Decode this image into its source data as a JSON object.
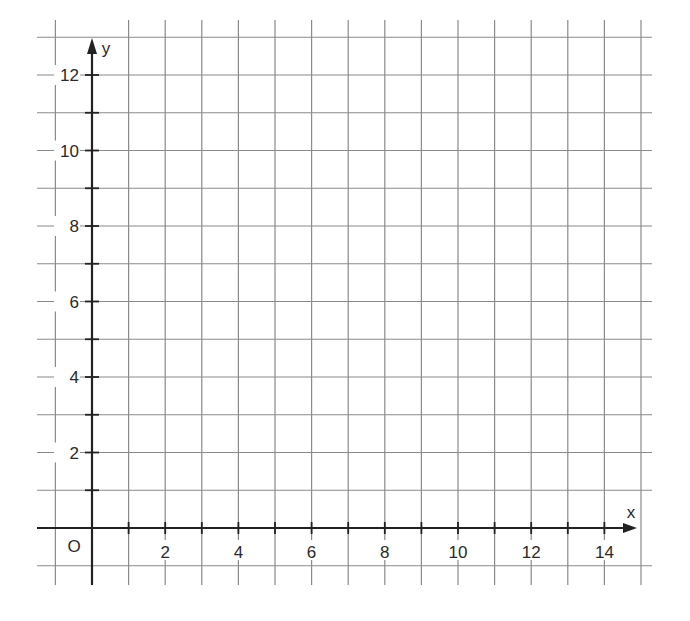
{
  "chart_data": {
    "type": "scatter",
    "title": "",
    "xlabel": "x",
    "ylabel": "y",
    "origin_label": "O",
    "xlim": [
      -1,
      15
    ],
    "ylim": [
      -1,
      13
    ],
    "grid": true,
    "grid_step": 1,
    "x_ticks": [
      2,
      4,
      6,
      8,
      10,
      12,
      14
    ],
    "y_ticks": [
      2,
      4,
      6,
      8,
      10,
      12
    ],
    "x_tick_labels": [
      "2",
      "4",
      "6",
      "8",
      "10",
      "12",
      "14"
    ],
    "y_tick_labels": [
      "2",
      "4",
      "6",
      "8",
      "10",
      "12"
    ],
    "series": [],
    "colors": {
      "grid": "#8a8a8a",
      "axis": "#222222",
      "text": "#2a2a2a"
    }
  }
}
